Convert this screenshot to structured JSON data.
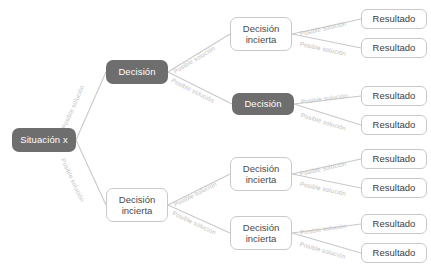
{
  "diagram": {
    "type": "decision-tree",
    "colors": {
      "node_dark_bg": "#6e6e6e",
      "node_dark_text": "#ffffff",
      "node_light_bg": "#ffffff",
      "node_light_text": "#4a4a4a",
      "border": "#c9c9c9",
      "edge": "#c9c9c9",
      "edge_label": "#bdbdbd",
      "canvas": "#ffffff"
    },
    "labels": {
      "situacion": "Situación x",
      "decision": "Decisión",
      "decision_incierta": "Decisión\nincierta",
      "resultado": "Resultado",
      "posible_solucion": "Posible solución"
    },
    "nodes": [
      {
        "id": "root",
        "label": "Situación x",
        "style": "dark",
        "x": 12,
        "y": 128,
        "w": 64,
        "h": 24
      },
      {
        "id": "d1",
        "label": "Decisión",
        "style": "dark",
        "x": 106,
        "y": 60,
        "w": 62,
        "h": 24
      },
      {
        "id": "d2",
        "label": "Decisión\nincierta",
        "style": "light",
        "x": 230,
        "y": 17,
        "w": 62,
        "h": 34
      },
      {
        "id": "d3",
        "label": "Decisión",
        "style": "dark",
        "x": 232,
        "y": 93,
        "w": 62,
        "h": 22
      },
      {
        "id": "d4",
        "label": "Decisión\nincierta",
        "style": "light",
        "x": 106,
        "y": 188,
        "w": 62,
        "h": 34
      },
      {
        "id": "d5",
        "label": "Decisión\nincierta",
        "style": "light",
        "x": 230,
        "y": 157,
        "w": 62,
        "h": 34
      },
      {
        "id": "d6",
        "label": "Decisión\nincierta",
        "style": "light",
        "x": 230,
        "y": 216,
        "w": 62,
        "h": 34
      },
      {
        "id": "r1",
        "label": "Resultado",
        "style": "result",
        "x": 361,
        "y": 9,
        "w": 66,
        "h": 20
      },
      {
        "id": "r2",
        "label": "Resultado",
        "style": "result",
        "x": 361,
        "y": 38,
        "w": 66,
        "h": 20
      },
      {
        "id": "r3",
        "label": "Resultado",
        "style": "result",
        "x": 361,
        "y": 86,
        "w": 66,
        "h": 20
      },
      {
        "id": "r4",
        "label": "Resultado",
        "style": "result",
        "x": 361,
        "y": 115,
        "w": 66,
        "h": 20
      },
      {
        "id": "r5",
        "label": "Resultado",
        "style": "result",
        "x": 361,
        "y": 149,
        "w": 66,
        "h": 20
      },
      {
        "id": "r6",
        "label": "Resultado",
        "style": "result",
        "x": 361,
        "y": 178,
        "w": 66,
        "h": 20
      },
      {
        "id": "r7",
        "label": "Resultado",
        "style": "result",
        "x": 361,
        "y": 214,
        "w": 66,
        "h": 20
      },
      {
        "id": "r8",
        "label": "Resultado",
        "style": "result",
        "x": 361,
        "y": 243,
        "w": 66,
        "h": 20
      }
    ],
    "edges": [
      {
        "id": "e1",
        "from": "root",
        "to": "d1",
        "label": "Posible solución",
        "x1": 76,
        "y1": 140,
        "x2": 106,
        "y2": 72,
        "lx": 63,
        "ly": 125,
        "rot": -66
      },
      {
        "id": "e2",
        "from": "root",
        "to": "d4",
        "label": "Posible solución",
        "x1": 76,
        "y1": 140,
        "x2": 106,
        "y2": 205,
        "lx": 63,
        "ly": 155,
        "rot": 65
      },
      {
        "id": "e3",
        "from": "d1",
        "to": "d2",
        "label": "Posible solución",
        "x1": 168,
        "y1": 72,
        "x2": 230,
        "y2": 34,
        "lx": 174,
        "ly": 68,
        "rot": -31
      },
      {
        "id": "e4",
        "from": "d1",
        "to": "d3",
        "label": "Posible solución",
        "x1": 168,
        "y1": 72,
        "x2": 232,
        "y2": 104,
        "lx": 172,
        "ly": 76,
        "rot": 27
      },
      {
        "id": "e5",
        "from": "d2",
        "to": "r1",
        "label": "Posible solución",
        "x1": 292,
        "y1": 34,
        "x2": 361,
        "y2": 19,
        "lx": 300,
        "ly": 30,
        "rot": -13
      },
      {
        "id": "e6",
        "from": "d2",
        "to": "r2",
        "label": "Posible solución",
        "x1": 292,
        "y1": 34,
        "x2": 361,
        "y2": 48,
        "lx": 300,
        "ly": 40,
        "rot": 12
      },
      {
        "id": "e7",
        "from": "d3",
        "to": "r3",
        "label": "Posible solución",
        "x1": 294,
        "y1": 104,
        "x2": 361,
        "y2": 96,
        "lx": 301,
        "ly": 98,
        "rot": -8
      },
      {
        "id": "e8",
        "from": "d3",
        "to": "r4",
        "label": "Posible solución",
        "x1": 294,
        "y1": 104,
        "x2": 361,
        "y2": 125,
        "lx": 301,
        "ly": 111,
        "rot": 17
      },
      {
        "id": "e9",
        "from": "d4",
        "to": "d5",
        "label": "Posible solución",
        "x1": 168,
        "y1": 205,
        "x2": 230,
        "y2": 174,
        "lx": 174,
        "ly": 201,
        "rot": -27
      },
      {
        "id": "e10",
        "from": "d4",
        "to": "d6",
        "label": "Posible solución",
        "x1": 168,
        "y1": 205,
        "x2": 230,
        "y2": 233,
        "lx": 173,
        "ly": 209,
        "rot": 25
      },
      {
        "id": "e11",
        "from": "d5",
        "to": "r5",
        "label": "Posible solución",
        "x1": 292,
        "y1": 174,
        "x2": 361,
        "y2": 159,
        "lx": 300,
        "ly": 170,
        "rot": -13
      },
      {
        "id": "e12",
        "from": "d5",
        "to": "r6",
        "label": "Posible solución",
        "x1": 292,
        "y1": 174,
        "x2": 361,
        "y2": 188,
        "lx": 300,
        "ly": 180,
        "rot": 12
      },
      {
        "id": "e13",
        "from": "d6",
        "to": "r7",
        "label": "Posible solución",
        "x1": 292,
        "y1": 233,
        "x2": 361,
        "y2": 224,
        "lx": 300,
        "ly": 229,
        "rot": -9
      },
      {
        "id": "e14",
        "from": "d6",
        "to": "r8",
        "label": "Posible solución",
        "x1": 292,
        "y1": 233,
        "x2": 361,
        "y2": 253,
        "lx": 300,
        "ly": 240,
        "rot": 16
      }
    ]
  }
}
